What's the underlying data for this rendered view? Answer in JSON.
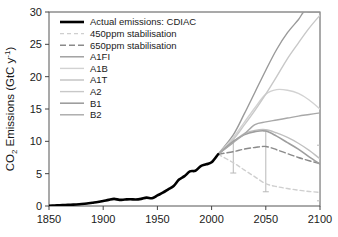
{
  "chart_data": {
    "type": "line",
    "title": "",
    "xlabel": "",
    "ylabel": "CO2 Emissions (GtC y-1)",
    "ylabel_parts": {
      "main": "CO",
      "sub": "2",
      "rest": " Emissions (GtC y",
      "sup": "-1",
      "tail": ")"
    },
    "xlim": [
      1850,
      2100
    ],
    "ylim": [
      0,
      30
    ],
    "xticks": [
      1850,
      1900,
      1950,
      2000,
      2050,
      2100
    ],
    "yticks": [
      0,
      5,
      10,
      15,
      20,
      25,
      30
    ],
    "xtick_labels": [
      "1850",
      "1900",
      "1950",
      "2000",
      "2050",
      "2100"
    ],
    "ytick_labels": [
      "0",
      "5",
      "10",
      "15",
      "20",
      "25",
      "30"
    ],
    "grid": false,
    "legend_position": "top-left",
    "series": [
      {
        "name": "Actual emissions: CDIAC",
        "color": "#000000",
        "width": 2.6,
        "dash": "none",
        "x": [
          1850,
          1855,
          1860,
          1865,
          1870,
          1875,
          1880,
          1885,
          1890,
          1895,
          1900,
          1905,
          1910,
          1915,
          1920,
          1925,
          1930,
          1935,
          1940,
          1945,
          1950,
          1955,
          1960,
          1965,
          1970,
          1975,
          1980,
          1985,
          1990,
          1995,
          2000,
          2006
        ],
        "y": [
          0.05,
          0.08,
          0.11,
          0.15,
          0.19,
          0.24,
          0.3,
          0.38,
          0.5,
          0.62,
          0.77,
          0.95,
          1.1,
          0.95,
          1.0,
          1.05,
          1.0,
          1.1,
          1.3,
          1.2,
          1.63,
          2.05,
          2.57,
          3.1,
          4.09,
          4.62,
          5.35,
          5.45,
          6.15,
          6.45,
          6.75,
          8.0
        ],
        "note": "historical observed fossil-fuel CO2 emissions"
      },
      {
        "name": "450ppm stabilisation",
        "color": "#cfcfcf",
        "width": 1.4,
        "dash": "4,3",
        "x": [
          2006,
          2020,
          2030,
          2040,
          2050,
          2060,
          2070,
          2080,
          2090,
          2100
        ],
        "y": [
          8.0,
          6.7,
          5.6,
          4.5,
          3.45,
          3.0,
          2.7,
          2.45,
          2.25,
          2.1
        ]
      },
      {
        "name": "650ppm stabilisation",
        "color": "#8a8a8a",
        "width": 1.4,
        "dash": "6,3",
        "x": [
          2006,
          2020,
          2030,
          2040,
          2050,
          2060,
          2070,
          2080,
          2090,
          2100
        ],
        "y": [
          8.0,
          8.4,
          8.8,
          9.05,
          9.2,
          8.7,
          8.1,
          7.5,
          7.0,
          6.55
        ]
      },
      {
        "name": "A1FI",
        "color": "#9a9a9a",
        "width": 1.4,
        "dash": "none",
        "x": [
          2006,
          2020,
          2030,
          2040,
          2050,
          2060,
          2070,
          2080,
          2085,
          2090,
          2100
        ],
        "y": [
          8.0,
          11.0,
          14.2,
          17.6,
          21.0,
          24.2,
          26.8,
          28.8,
          30.0,
          30.0,
          30.0
        ]
      },
      {
        "name": "A1B",
        "color": "#d2d2d2",
        "width": 1.4,
        "dash": "none",
        "x": [
          2006,
          2020,
          2030,
          2040,
          2050,
          2060,
          2070,
          2080,
          2090,
          2100
        ],
        "y": [
          8.0,
          10.6,
          12.9,
          15.2,
          17.3,
          18.0,
          17.9,
          17.4,
          16.4,
          15.0
        ]
      },
      {
        "name": "A1T",
        "color": "#c0c0c0",
        "width": 1.4,
        "dash": "none",
        "x": [
          2006,
          2020,
          2030,
          2040,
          2050,
          2060,
          2070,
          2080,
          2090,
          2100
        ],
        "y": [
          8.0,
          9.9,
          11.2,
          11.7,
          11.8,
          11.3,
          10.6,
          9.7,
          8.6,
          7.3
        ]
      },
      {
        "name": "A2",
        "color": "#c8c8c8",
        "width": 1.4,
        "dash": "none",
        "x": [
          2006,
          2020,
          2030,
          2040,
          2050,
          2060,
          2070,
          2080,
          2090,
          2100
        ],
        "y": [
          8.0,
          10.3,
          12.5,
          14.8,
          17.3,
          20.0,
          22.8,
          25.2,
          27.5,
          29.5
        ]
      },
      {
        "name": "B1",
        "color": "#9e9e9e",
        "width": 1.6,
        "dash": "none",
        "x": [
          2006,
          2020,
          2030,
          2040,
          2050,
          2060,
          2070,
          2080,
          2090,
          2100
        ],
        "y": [
          8.0,
          10.0,
          11.0,
          11.5,
          11.6,
          10.8,
          9.8,
          8.8,
          7.6,
          6.5
        ]
      },
      {
        "name": "B2",
        "color": "#a8a8a8",
        "width": 1.4,
        "dash": "none",
        "x": [
          2006,
          2020,
          2030,
          2040,
          2050,
          2060,
          2070,
          2080,
          2090,
          2100
        ],
        "y": [
          8.0,
          9.8,
          11.1,
          12.6,
          13.0,
          13.3,
          13.6,
          13.9,
          14.15,
          14.4
        ]
      }
    ],
    "error_bars": [
      {
        "x": 2020,
        "lower": 5.1,
        "upper": 10.2,
        "center": 7.6,
        "color": "#b8b8b8"
      },
      {
        "x": 2050,
        "lower": 2.2,
        "upper": 11.6,
        "center": 7.0,
        "color": "#b8b8b8"
      },
      {
        "x": 2100,
        "lower": 0.8,
        "upper": 9.4,
        "center": 5.0,
        "color": "#b8b8b8"
      }
    ],
    "legend_entries": [
      {
        "label": "Actual emissions: CDIAC",
        "color": "#000000",
        "dash": "none",
        "width": 2.6
      },
      {
        "label": "450ppm stabilisation",
        "color": "#cfcfcf",
        "dash": "4,3",
        "width": 1.4
      },
      {
        "label": "650ppm stabilisation",
        "color": "#8a8a8a",
        "dash": "6,3",
        "width": 1.4
      },
      {
        "label": "A1FI",
        "color": "#9a9a9a",
        "dash": "none",
        "width": 1.4
      },
      {
        "label": "A1B",
        "color": "#d2d2d2",
        "dash": "none",
        "width": 1.4
      },
      {
        "label": "A1T",
        "color": "#c0c0c0",
        "dash": "none",
        "width": 1.4
      },
      {
        "label": "A2",
        "color": "#c8c8c8",
        "dash": "none",
        "width": 1.4
      },
      {
        "label": "B1",
        "color": "#9e9e9e",
        "dash": "none",
        "width": 1.6
      },
      {
        "label": "B2",
        "color": "#a8a8a8",
        "dash": "none",
        "width": 1.4
      }
    ]
  }
}
